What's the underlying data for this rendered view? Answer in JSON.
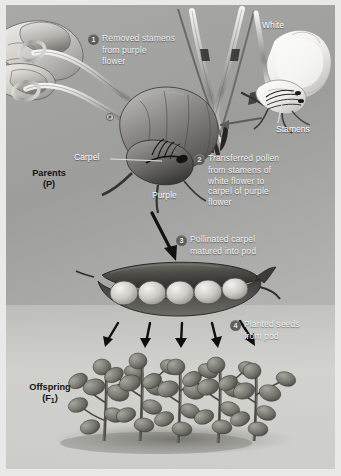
{
  "figure": {
    "background_color": "#a9aaa8",
    "panel_border_color": "#e9e9e7"
  },
  "steps": [
    {
      "number": "1",
      "lines": [
        "Removed stamens",
        "from purple",
        "flower"
      ]
    },
    {
      "number": "2",
      "lines": [
        "Transferred pollen",
        "from stamens of",
        "white flower to",
        "carpel of purple",
        "flower"
      ]
    },
    {
      "number": "3",
      "lines": [
        "Pollinated carpel",
        "matured into pod"
      ]
    },
    {
      "number": "4",
      "lines": [
        "Planted seeds",
        "from pod"
      ]
    }
  ],
  "part_labels": {
    "white": "White",
    "stamens": "Stamens",
    "carpel": "Carpel",
    "purple": "Purple"
  },
  "generation_labels": {
    "parents": "Parents",
    "parents_symbol": "(P)",
    "offspring": "Offspring",
    "offspring_symbol_prefix": "(F",
    "offspring_symbol_sub": "1",
    "offspring_symbol_suffix": ")"
  },
  "illustration": {
    "pod_seed_count": 5,
    "offspring_plant_count": 5,
    "planting_arrow_count": 5,
    "icons": [
      "hand-icon",
      "forceps-icon",
      "tweezers-icon",
      "purple-flower-icon",
      "white-flower-icon",
      "pea-pod-icon",
      "pea-plant-icon",
      "arrow-icon"
    ]
  }
}
